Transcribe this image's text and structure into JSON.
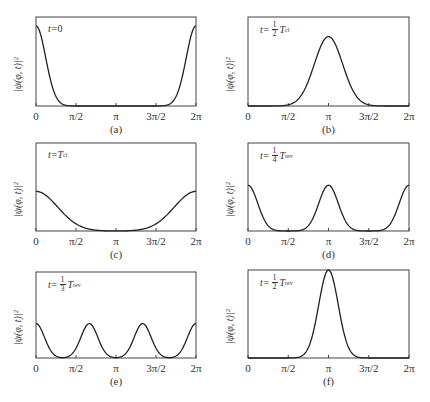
{
  "figure": {
    "ylabel": "|ψ(φ, t)|²",
    "xtick_labels": [
      "0",
      "π/2",
      "π",
      "3π/2",
      "2π"
    ],
    "panels": [
      {
        "id": "a",
        "caption": "(a)",
        "t_prefix": "t=",
        "t_value": "0",
        "frac": null,
        "T": null,
        "T_sub": null
      },
      {
        "id": "b",
        "caption": "(b)",
        "t_prefix": "t=",
        "t_value": "",
        "frac": {
          "num": "1",
          "den": "2"
        },
        "T": "T",
        "T_sub": "cl"
      },
      {
        "id": "c",
        "caption": "(c)",
        "t_prefix": "t=",
        "t_value": "",
        "frac": null,
        "T": "T",
        "T_sub": "cl"
      },
      {
        "id": "d",
        "caption": "(d)",
        "t_prefix": "t=",
        "t_value": "",
        "frac": {
          "num": "1",
          "den": "4"
        },
        "T": "T",
        "T_sub": "rev"
      },
      {
        "id": "e",
        "caption": "(e)",
        "t_prefix": "t=",
        "t_value": "",
        "frac": {
          "num": "1",
          "den": "3"
        },
        "T": "T",
        "T_sub": "rev"
      },
      {
        "id": "f",
        "caption": "(f)",
        "t_prefix": "t=",
        "t_value": "",
        "frac": {
          "num": "1",
          "den": "2"
        },
        "T": "T",
        "T_sub": "rev"
      }
    ]
  },
  "chart_data": [
    {
      "type": "line",
      "title": "t=0",
      "caption": "(a)",
      "xlabel": "",
      "ylabel": "|ψ(φ,t)|²",
      "xlim": [
        0,
        6.2832
      ],
      "ylim": [
        0,
        1.1
      ],
      "x_ticks": [
        "0",
        "π/2",
        "π",
        "3π/2",
        "2π"
      ],
      "series": [
        {
          "name": "|ψ|²",
          "shape": "gaussian peaks centered at 0 and 2π",
          "centers": [
            0,
            6.2832
          ],
          "width": 0.38,
          "amplitude": 1.0
        }
      ]
    },
    {
      "type": "line",
      "title": "t=½T_cl",
      "caption": "(b)",
      "xlabel": "",
      "ylabel": "|ψ(φ,t)|²",
      "xlim": [
        0,
        6.2832
      ],
      "ylim": [
        0,
        1.1
      ],
      "x_ticks": [
        "0",
        "π/2",
        "π",
        "3π/2",
        "2π"
      ],
      "series": [
        {
          "name": "|ψ|²",
          "shape": "single broadened gaussian at π",
          "centers": [
            3.1416
          ],
          "width": 0.55,
          "amplitude": 0.72
        }
      ]
    },
    {
      "type": "line",
      "title": "t=T_cl",
      "caption": "(c)",
      "xlabel": "",
      "ylabel": "|ψ(φ,t)|²",
      "xlim": [
        0,
        6.2832
      ],
      "ylim": [
        0,
        1.1
      ],
      "x_ticks": [
        "0",
        "π/2",
        "π",
        "3π/2",
        "2π"
      ],
      "series": [
        {
          "name": "|ψ|²",
          "shape": "broad spread peaks at 0 and 2π",
          "centers": [
            0,
            6.2832
          ],
          "width": 0.85,
          "amplitude": 0.47
        }
      ]
    },
    {
      "type": "line",
      "title": "t=¼T_rev",
      "caption": "(d)",
      "xlabel": "",
      "ylabel": "|ψ(φ,t)|²",
      "xlim": [
        0,
        6.2832
      ],
      "ylim": [
        0,
        1.1
      ],
      "x_ticks": [
        "0",
        "π/2",
        "π",
        "3π/2",
        "2π"
      ],
      "series": [
        {
          "name": "|ψ|²",
          "shape": "two sub-packets at 0(2π) and π",
          "centers": [
            0,
            3.1416,
            6.2832
          ],
          "width": 0.38,
          "amplitude": 0.5
        }
      ]
    },
    {
      "type": "line",
      "title": "t=⅓T_rev",
      "caption": "(e)",
      "xlabel": "",
      "ylabel": "|ψ(φ,t)|²",
      "xlim": [
        0,
        6.2832
      ],
      "ylim": [
        0,
        1.1
      ],
      "x_ticks": [
        "0",
        "π/2",
        "π",
        "3π/2",
        "2π"
      ],
      "series": [
        {
          "name": "|ψ|²",
          "shape": "three sub-packets at 0, 2π/3, 4π/3",
          "centers": [
            0,
            2.0944,
            4.1888,
            6.2832
          ],
          "width": 0.33,
          "amplitude": 0.33
        }
      ]
    },
    {
      "type": "line",
      "title": "t=½T_rev",
      "caption": "(f)",
      "xlabel": "",
      "ylabel": "|ψ(φ,t)|²",
      "xlim": [
        0,
        6.2832
      ],
      "ylim": [
        0,
        1.0
      ],
      "x_ticks": [
        "0",
        "π/2",
        "π",
        "3π/2",
        "2π"
      ],
      "series": [
        {
          "name": "|ψ|²",
          "shape": "revived packet at π",
          "centers": [
            3.1416
          ],
          "width": 0.38,
          "amplitude": 1.0
        }
      ]
    }
  ]
}
